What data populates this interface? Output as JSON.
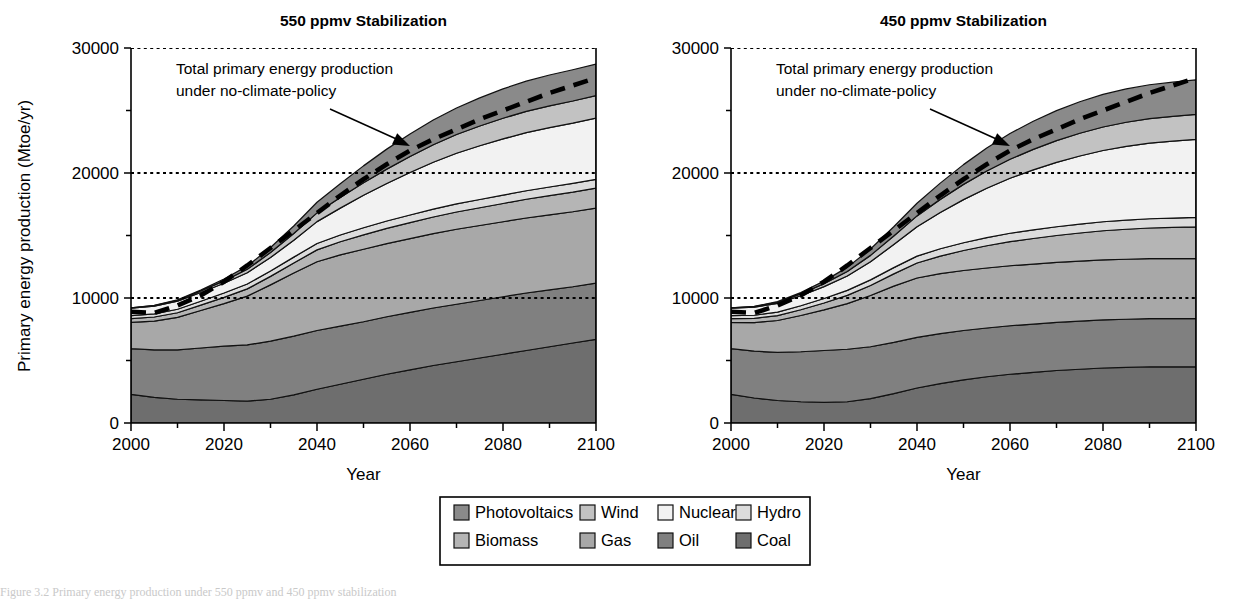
{
  "figure": {
    "caption_sliver": "Figure 3.2  Primary energy production under 550 ppmv and 450 ppmv stabilization"
  },
  "axes": {
    "ylabel": "Primary energy production (Mtoe/yr)",
    "xlabel": "Year",
    "y_ticks": [
      "0",
      "10000",
      "20000",
      "30000"
    ],
    "y_tick_values": [
      0,
      10000,
      20000,
      30000
    ],
    "y_minor_values": [
      5000,
      15000,
      25000
    ],
    "x_ticks": [
      "2000",
      "2020",
      "2040",
      "2060",
      "2080",
      "2100"
    ],
    "x_tick_values": [
      2000,
      2020,
      2040,
      2060,
      2080,
      2100
    ],
    "xlim": [
      2000,
      2100
    ],
    "ylim": [
      0,
      30000
    ],
    "gridlines": [
      10000,
      20000,
      30000
    ]
  },
  "annotation": {
    "line1": "Total primary energy production",
    "line2": "under no-climate-policy"
  },
  "legend": {
    "items": [
      {
        "label": "Photovoltaics",
        "color": "#8a8a8a"
      },
      {
        "label": "Wind",
        "color": "#c2c2c2"
      },
      {
        "label": "Nuclear",
        "color": "#f2f2f2"
      },
      {
        "label": "Hydro",
        "color": "#dcdcdc"
      },
      {
        "label": "Biomass",
        "color": "#b5b5b5"
      },
      {
        "label": "Gas",
        "color": "#a8a8a8"
      },
      {
        "label": "Oil",
        "color": "#808080"
      },
      {
        "label": "Coal",
        "color": "#6e6e6e"
      }
    ]
  },
  "chart_data": [
    {
      "type": "area",
      "title": "550 ppmv Stabilization",
      "xlabel": "Year",
      "ylabel": "Primary energy production (Mtoe/yr)",
      "xlim": [
        2000,
        2100
      ],
      "ylim": [
        0,
        30000
      ],
      "grid": true,
      "legend_position": "bottom",
      "stacked": true,
      "x": [
        2000,
        2005,
        2010,
        2015,
        2020,
        2025,
        2030,
        2035,
        2040,
        2045,
        2050,
        2055,
        2060,
        2065,
        2070,
        2075,
        2080,
        2085,
        2090,
        2095,
        2100
      ],
      "series": [
        {
          "name": "Coal",
          "values": [
            2300,
            2050,
            1900,
            1850,
            1800,
            1750,
            1900,
            2250,
            2700,
            3100,
            3500,
            3900,
            4250,
            4600,
            4900,
            5200,
            5500,
            5800,
            6100,
            6400,
            6700
          ]
        },
        {
          "name": "Oil",
          "values": [
            3650,
            3800,
            3950,
            4150,
            4350,
            4500,
            4650,
            4700,
            4700,
            4650,
            4600,
            4600,
            4600,
            4600,
            4600,
            4600,
            4600,
            4600,
            4550,
            4500,
            4500
          ]
        },
        {
          "name": "Gas",
          "values": [
            2100,
            2300,
            2600,
            3000,
            3400,
            3900,
            4500,
            5050,
            5500,
            5700,
            5800,
            5850,
            5900,
            5950,
            6000,
            6000,
            6000,
            6000,
            6000,
            6000,
            6000
          ]
        },
        {
          "name": "Biomass",
          "values": [
            300,
            330,
            370,
            430,
            500,
            580,
            680,
            800,
            950,
            1050,
            1150,
            1220,
            1280,
            1330,
            1380,
            1420,
            1460,
            1500,
            1540,
            1570,
            1600
          ]
        },
        {
          "name": "Hydro",
          "values": [
            230,
            250,
            280,
            310,
            350,
            390,
            430,
            470,
            510,
            540,
            570,
            590,
            610,
            630,
            650,
            660,
            670,
            680,
            690,
            700,
            700
          ]
        },
        {
          "name": "Nuclear",
          "values": [
            600,
            620,
            650,
            700,
            780,
            900,
            1080,
            1350,
            1750,
            2150,
            2600,
            3000,
            3400,
            3750,
            4050,
            4300,
            4500,
            4650,
            4750,
            4820,
            4900
          ]
        },
        {
          "name": "Wind",
          "values": [
            20,
            40,
            70,
            120,
            190,
            280,
            400,
            540,
            700,
            850,
            1000,
            1150,
            1280,
            1400,
            1500,
            1580,
            1650,
            1700,
            1740,
            1770,
            1800
          ]
        },
        {
          "name": "Photovoltaics",
          "values": [
            10,
            20,
            40,
            80,
            150,
            250,
            400,
            600,
            850,
            1100,
            1350,
            1600,
            1800,
            1980,
            2120,
            2250,
            2350,
            2420,
            2470,
            2500,
            2520
          ]
        }
      ],
      "reference_line": {
        "name": "Total primary energy production under no-climate-policy",
        "style": "dashed",
        "x": [
          2000,
          2005,
          2010,
          2015,
          2020,
          2025,
          2030,
          2035,
          2040,
          2045,
          2050,
          2055,
          2060,
          2065,
          2070,
          2075,
          2080,
          2085,
          2090,
          2095,
          2100
        ],
        "values": [
          8900,
          8800,
          9400,
          10200,
          11300,
          12600,
          14000,
          15400,
          16800,
          18200,
          19500,
          20700,
          21800,
          22700,
          23500,
          24300,
          25000,
          25700,
          26400,
          27000,
          27600
        ]
      },
      "totals": [
        9210,
        9410,
        9860,
        10640,
        11520,
        12550,
        14040,
        15760,
        17660,
        19140,
        20570,
        21910,
        23120,
        24240,
        25200,
        26010,
        26730,
        27350,
        27840,
        28260,
        28720
      ]
    },
    {
      "type": "area",
      "title": "450 ppmv Stabilization",
      "xlabel": "Year",
      "ylabel": "Primary energy production (Mtoe/yr)",
      "xlim": [
        2000,
        2100
      ],
      "ylim": [
        0,
        30000
      ],
      "grid": true,
      "legend_position": "bottom",
      "stacked": true,
      "x": [
        2000,
        2005,
        2010,
        2015,
        2020,
        2025,
        2030,
        2035,
        2040,
        2045,
        2050,
        2055,
        2060,
        2065,
        2070,
        2075,
        2080,
        2085,
        2090,
        2095,
        2100
      ],
      "series": [
        {
          "name": "Coal",
          "values": [
            2300,
            2000,
            1800,
            1700,
            1650,
            1700,
            1950,
            2350,
            2800,
            3150,
            3450,
            3700,
            3900,
            4050,
            4200,
            4300,
            4400,
            4450,
            4500,
            4500,
            4500
          ]
        },
        {
          "name": "Oil",
          "values": [
            3650,
            3750,
            3850,
            4000,
            4150,
            4200,
            4150,
            4100,
            4050,
            4000,
            3950,
            3900,
            3880,
            3860,
            3850,
            3850,
            3850,
            3850,
            3850,
            3850,
            3850
          ]
        },
        {
          "name": "Gas",
          "values": [
            2100,
            2280,
            2550,
            2900,
            3250,
            3650,
            4100,
            4500,
            4750,
            4800,
            4800,
            4800,
            4800,
            4800,
            4800,
            4800,
            4800,
            4800,
            4800,
            4800,
            4800
          ]
        },
        {
          "name": "Biomass",
          "values": [
            300,
            340,
            390,
            460,
            550,
            660,
            800,
            980,
            1200,
            1400,
            1600,
            1780,
            1930,
            2050,
            2150,
            2250,
            2330,
            2400,
            2450,
            2500,
            2550
          ]
        },
        {
          "name": "Hydro",
          "values": [
            230,
            250,
            280,
            320,
            360,
            400,
            450,
            500,
            550,
            590,
            620,
            650,
            670,
            690,
            700,
            710,
            720,
            730,
            740,
            745,
            750
          ]
        },
        {
          "name": "Nuclear",
          "values": [
            600,
            640,
            700,
            800,
            950,
            1150,
            1450,
            1850,
            2350,
            2900,
            3450,
            3950,
            4400,
            4800,
            5150,
            5450,
            5700,
            5900,
            6050,
            6150,
            6250
          ]
        },
        {
          "name": "Wind",
          "values": [
            20,
            45,
            85,
            150,
            240,
            360,
            510,
            680,
            870,
            1050,
            1220,
            1380,
            1520,
            1640,
            1740,
            1820,
            1880,
            1930,
            1960,
            1980,
            2000
          ]
        },
        {
          "name": "Photovoltaics",
          "values": [
            10,
            25,
            55,
            110,
            200,
            330,
            510,
            740,
            1010,
            1300,
            1580,
            1840,
            2060,
            2250,
            2400,
            2520,
            2610,
            2670,
            2710,
            2740,
            2760
          ]
        }
      ],
      "reference_line": {
        "name": "Total primary energy production under no-climate-policy",
        "style": "dashed",
        "x": [
          2000,
          2005,
          2010,
          2015,
          2020,
          2025,
          2030,
          2035,
          2040,
          2045,
          2050,
          2055,
          2060,
          2065,
          2070,
          2075,
          2080,
          2085,
          2090,
          2095,
          2100
        ],
        "values": [
          8900,
          8800,
          9400,
          10200,
          11300,
          12600,
          14000,
          15400,
          16800,
          18200,
          19500,
          20700,
          21800,
          22700,
          23500,
          24300,
          25000,
          25700,
          26400,
          27000,
          27600
        ]
      },
      "totals": [
        9210,
        9330,
        9710,
        10440,
        11350,
        12450,
        13920,
        15700,
        17580,
        19190,
        20670,
        22000,
        23160,
        24140,
        24990,
        25700,
        26290,
        26730,
        27060,
        27265,
        27460
      ]
    }
  ]
}
